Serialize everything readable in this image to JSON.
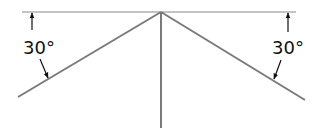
{
  "diagram": {
    "type": "angle-diagram",
    "colors": {
      "reference_line": "#b0b0b0",
      "main_lines": "#7a7a7a",
      "dimension": "#111111",
      "background": "#ffffff"
    },
    "labels": {
      "left_angle": "30°",
      "right_angle": "30°"
    },
    "angles": [
      {
        "side": "left",
        "value_deg": 30,
        "from": "horizontal reference line",
        "to": "left sloped line"
      },
      {
        "side": "right",
        "value_deg": 30,
        "from": "horizontal reference line",
        "to": "right sloped line"
      }
    ]
  }
}
